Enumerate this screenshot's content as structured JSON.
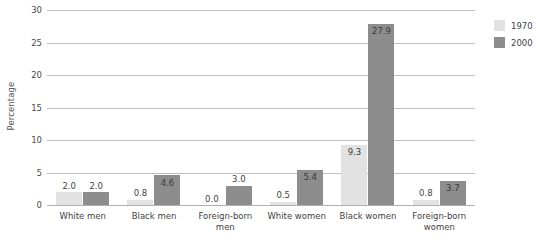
{
  "chart_data": {
    "type": "bar",
    "title": "",
    "subtitle": "",
    "xlabel": "",
    "ylabel": "Percentage",
    "ylim": [
      0,
      30
    ],
    "yticks": [
      "0",
      "5",
      "10",
      "15",
      "20",
      "25",
      "30"
    ],
    "ytick_values": [
      0,
      5,
      10,
      15,
      20,
      25,
      30
    ],
    "grid": true,
    "legend_position": "right-top",
    "categories": [
      "White men",
      "Black men",
      "Foreign-born men",
      "White women",
      "Black women",
      "Foreign-born women"
    ],
    "category_lines": [
      [
        "White men"
      ],
      [
        "Black men"
      ],
      [
        "Foreign-born",
        "men"
      ],
      [
        "White women"
      ],
      [
        "Black women"
      ],
      [
        "Foreign-born",
        "women"
      ]
    ],
    "series": [
      {
        "name": "1970",
        "color": "#e2e2e2",
        "values": [
          2.0,
          0.8,
          0.0,
          0.5,
          9.3,
          0.8
        ],
        "labels": [
          "2.0",
          "0.8",
          "0.0",
          "0.5",
          "9.3",
          "0.8"
        ]
      },
      {
        "name": "2000",
        "color": "#8d8d8d",
        "values": [
          2.0,
          4.6,
          3.0,
          5.4,
          27.9,
          3.7
        ],
        "labels": [
          "2.0",
          "4.6",
          "3.0",
          "5.4",
          "27.9",
          "3.7"
        ]
      }
    ]
  },
  "legend": {
    "items": [
      {
        "label": "1970",
        "color": "#e2e2e2"
      },
      {
        "label": "2000",
        "color": "#8d8d8d"
      }
    ]
  }
}
